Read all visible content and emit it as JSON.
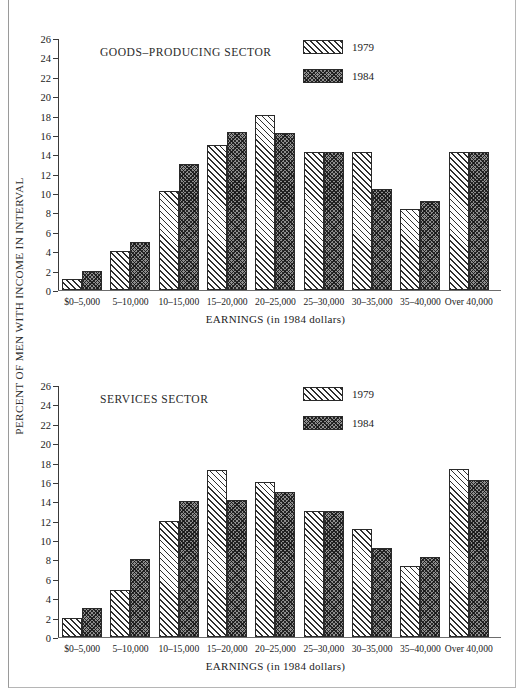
{
  "axis": {
    "ylabel": "PERCENT OF MEN WITH INCOME IN INTERVAL",
    "xlabel": "EARNINGS (in 1984 dollars)",
    "yticks": [
      0,
      2,
      4,
      6,
      8,
      10,
      12,
      14,
      16,
      18,
      20,
      22,
      24,
      26
    ]
  },
  "legend": {
    "series1": "1979",
    "series2": "1984"
  },
  "panels": [
    {
      "id": "goods",
      "title": "GOODS-PRODUCING SECTOR"
    },
    {
      "id": "services",
      "title": "SERVICES SECTOR"
    }
  ],
  "chart_data": [
    {
      "type": "bar",
      "title": "GOODS-PRODUCING SECTOR",
      "xlabel": "EARNINGS (in 1984 dollars)",
      "ylabel": "PERCENT OF MEN WITH INCOME IN INTERVAL",
      "ylim": [
        0,
        26
      ],
      "ytick_step": 2,
      "grid": false,
      "legend_position": "top-right",
      "categories": [
        "$0-5,000",
        "5-10,000",
        "10-15,000",
        "15-20,000",
        "20-25,000",
        "25-30,000",
        "30-35,000",
        "35-40,000",
        "Over 40,000"
      ],
      "series": [
        {
          "name": "1979",
          "values": [
            1.1,
            4.0,
            10.2,
            15.0,
            18.1,
            14.2,
            14.2,
            8.4,
            14.2
          ]
        },
        {
          "name": "1984",
          "values": [
            2.0,
            5.0,
            13.0,
            16.3,
            16.2,
            14.2,
            10.4,
            9.2,
            14.2
          ]
        }
      ]
    },
    {
      "type": "bar",
      "title": "SERVICES SECTOR",
      "xlabel": "EARNINGS (in 1984 dollars)",
      "ylabel": "PERCENT OF MEN WITH INCOME IN INTERVAL",
      "ylim": [
        0,
        26
      ],
      "ytick_step": 2,
      "grid": false,
      "legend_position": "top-right",
      "categories": [
        "$0-5,000",
        "5-10,000",
        "10-15,000",
        "15-20,000",
        "20-25,000",
        "25-30,000",
        "30-35,000",
        "35-40,000",
        "Over 40,000"
      ],
      "series": [
        {
          "name": "1979",
          "values": [
            2.0,
            4.9,
            12.0,
            17.2,
            16.0,
            13.0,
            11.1,
            7.3,
            17.3
          ]
        },
        {
          "name": "1984",
          "values": [
            3.0,
            8.0,
            14.0,
            14.1,
            15.0,
            13.0,
            9.2,
            8.3,
            16.2
          ]
        }
      ]
    }
  ]
}
